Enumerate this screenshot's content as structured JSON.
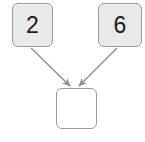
{
  "diagram": {
    "type": "operation-tree",
    "background_color": "#ffffff",
    "nodes": [
      {
        "id": "left-operand",
        "name": "node-left",
        "label": "2",
        "fill_color": "#e9e9e9",
        "border_color": "#9a9a9a",
        "x": 12,
        "y": 3,
        "width": 41,
        "height": 44
      },
      {
        "id": "right-operand",
        "name": "node-right",
        "label": "6",
        "fill_color": "#e9e9e9",
        "border_color": "#9a9a9a",
        "x": 98,
        "y": 3,
        "width": 44,
        "height": 44
      },
      {
        "id": "result",
        "name": "node-result",
        "label": "",
        "fill_color": "#ffffff",
        "border_color": "#9a9a9a",
        "x": 56,
        "y": 88,
        "width": 41,
        "height": 41
      }
    ],
    "edges": [
      {
        "id": "edge-left-to-result",
        "name": "arrow-left-to-result",
        "from": "left-operand",
        "to": "result",
        "color": "#8f8f8f",
        "x1": 31,
        "y1": 48,
        "x2": 70,
        "y2": 86
      },
      {
        "id": "edge-right-to-result",
        "name": "arrow-right-to-result",
        "from": "right-operand",
        "to": "result",
        "color": "#8f8f8f",
        "x1": 117,
        "y1": 48,
        "x2": 79,
        "y2": 86
      }
    ]
  }
}
